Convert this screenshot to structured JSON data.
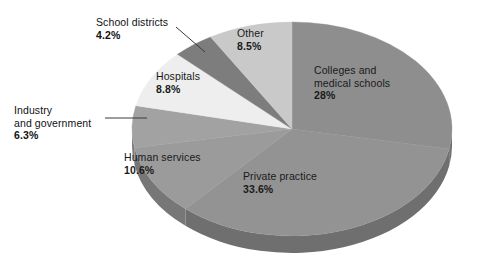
{
  "chart_data": {
    "type": "pie",
    "title": "",
    "subtitle": "",
    "xlabel": "",
    "ylabel": "",
    "legend_position": "none",
    "grid": false,
    "value_unit": "percent",
    "total": 100,
    "categories": [
      "Colleges and medical schools",
      "Private practice",
      "Human services",
      "Industry and government",
      "Hospitals",
      "School districts",
      "Other"
    ],
    "values": [
      28,
      33.6,
      10.6,
      6.3,
      8.8,
      4.2,
      8.5
    ],
    "slices": [
      {
        "label": "Colleges and medical schools",
        "label_line1": "Colleges and",
        "label_line2": "medical schools",
        "value": 28,
        "percent_text": "28%",
        "color": "#8e8e8e",
        "side_color": "#6f6f6f",
        "label_placement": "inside",
        "start_deg": 0,
        "end_deg": 100.8
      },
      {
        "label": "Private practice",
        "label_line1": "Private practice",
        "label_line2": "",
        "value": 33.6,
        "percent_text": "33.6%",
        "color": "#939393",
        "side_color": "#6f6f6f",
        "label_placement": "inside",
        "start_deg": 100.8,
        "end_deg": 221.76
      },
      {
        "label": "Human services",
        "label_line1": "Human services",
        "label_line2": "",
        "value": 10.6,
        "percent_text": "10.6%",
        "color": "#9b9b9b",
        "side_color": "#777777",
        "label_placement": "inside",
        "start_deg": 221.76,
        "end_deg": 259.92
      },
      {
        "label": "Industry and government",
        "label_line1": "Industry",
        "label_line2": "and government",
        "value": 6.3,
        "percent_text": "6.3%",
        "color": "#a2a2a2",
        "side_color": "#7d7d7d",
        "label_placement": "outside",
        "start_deg": 259.92,
        "end_deg": 282.6
      },
      {
        "label": "Hospitals",
        "label_line1": "Hospitals",
        "label_line2": "",
        "value": 8.8,
        "percent_text": "8.8%",
        "color": "#eeeeee",
        "side_color": "#c4c4c4",
        "label_placement": "inside",
        "start_deg": 282.6,
        "end_deg": 314.28
      },
      {
        "label": "School districts",
        "label_line1": "School districts",
        "label_line2": "",
        "value": 4.2,
        "percent_text": "4.2%",
        "color": "#7d7d7d",
        "side_color": "#636363",
        "label_placement": "outside",
        "start_deg": 314.28,
        "end_deg": 329.4
      },
      {
        "label": "Other",
        "label_line1": "Other",
        "label_line2": "",
        "value": 8.5,
        "percent_text": "8.5%",
        "color": "#c9c9c9",
        "side_color": "#a3a3a3",
        "label_placement": "inside",
        "start_deg": 329.4,
        "end_deg": 360
      }
    ]
  },
  "colors": {
    "background": "#ffffff",
    "text": "#1a1a1a",
    "leader_line": "#3a3a3a"
  }
}
